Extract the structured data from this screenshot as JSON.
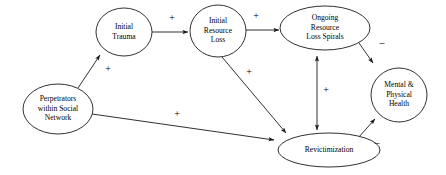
{
  "diagram": {
    "type": "causal-loop-path-diagram",
    "background_color": "#ffffff",
    "stroke_color": "#1a1a1a",
    "text_color": "#000000",
    "nodes": [
      {
        "id": "perpetrators",
        "shape": "ellipse",
        "cx": 58,
        "cy": 109,
        "rx": 35,
        "ry": 25,
        "lines": [
          "Perpetrators",
          "within Social",
          "Network"
        ]
      },
      {
        "id": "initial-trauma",
        "shape": "ellipse",
        "cx": 124,
        "cy": 32,
        "rx": 28,
        "ry": 24,
        "lines": [
          "Initial",
          "Trauma"
        ]
      },
      {
        "id": "initial-resource-loss",
        "shape": "ellipse",
        "cx": 218,
        "cy": 31,
        "rx": 28,
        "ry": 26,
        "lines": [
          "Initial",
          "Resource",
          "Loss"
        ]
      },
      {
        "id": "ongoing-resource-loss-spirals",
        "shape": "ellipse",
        "cx": 325,
        "cy": 28,
        "rx": 45,
        "ry": 22,
        "lines": [
          "Ongoing",
          "Resource",
          "Loss Spirals"
        ]
      },
      {
        "id": "mental-physical-health",
        "shape": "ellipse",
        "cx": 399,
        "cy": 95,
        "rx": 28,
        "ry": 27,
        "lines": [
          "Mental &",
          "Physical",
          "Health"
        ]
      },
      {
        "id": "revictimization",
        "shape": "ellipse",
        "cx": 329,
        "cy": 150,
        "rx": 51,
        "ry": 17,
        "lines": [
          "Revictimization"
        ]
      }
    ],
    "edges": [
      {
        "id": "perpetrators-to-initial-trauma",
        "from": "perpetrators",
        "to": "initial-trauma",
        "sign": "+",
        "sign_x": 108,
        "sign_y": 70,
        "path": "M 78,88 L 100,55",
        "arrow_end": true,
        "arrow_start": false
      },
      {
        "id": "initial-trauma-to-initial-resource-loss",
        "from": "initial-trauma",
        "to": "initial-resource-loss",
        "sign": "+",
        "sign_x": 172,
        "sign_y": 19,
        "path": "M 152,32 L 188,32",
        "arrow_end": true,
        "arrow_start": false
      },
      {
        "id": "initial-resource-loss-to-ongoing-spirals",
        "from": "initial-resource-loss",
        "to": "ongoing-resource-loss-spirals",
        "sign": "+",
        "sign_x": 256,
        "sign_y": 17,
        "path": "M 246,30 L 279,30",
        "arrow_end": true,
        "arrow_start": false
      },
      {
        "id": "initial-resource-loss-to-revictimization",
        "from": "initial-resource-loss",
        "to": "revictimization",
        "sign": "+",
        "sign_x": 249,
        "sign_y": 73,
        "path": "M 222,57 L 286,133",
        "arrow_end": true,
        "arrow_start": false
      },
      {
        "id": "perpetrators-to-revictimization",
        "from": "perpetrators",
        "to": "revictimization",
        "sign": "+",
        "sign_x": 177,
        "sign_y": 115,
        "path": "M 92,114 L 274,140",
        "arrow_end": true,
        "arrow_start": false
      },
      {
        "id": "ongoing-spirals-revictimization",
        "from": "ongoing-resource-loss-spirals",
        "to": "revictimization",
        "sign": "+",
        "sign_x": 326,
        "sign_y": 91,
        "path": "M 317,56 L 317,130",
        "arrow_end": true,
        "arrow_start": true
      },
      {
        "id": "ongoing-spirals-to-health",
        "from": "ongoing-resource-loss-spirals",
        "to": "mental-physical-health",
        "sign": "–",
        "sign_x": 382,
        "sign_y": 44,
        "path": "M 359,43 L 373,63",
        "arrow_end": true,
        "arrow_start": false
      },
      {
        "id": "revictimization-to-health",
        "from": "revictimization",
        "to": "mental-physical-health",
        "sign": "–",
        "sign_x": 377,
        "sign_y": 144,
        "path": "M 358,138 L 375,119",
        "arrow_end": true,
        "arrow_start": false
      }
    ]
  }
}
